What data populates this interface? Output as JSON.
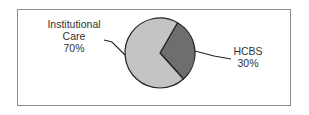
{
  "chart_data": {
    "type": "pie",
    "title": "",
    "slices": [
      {
        "name": "Institutional Care",
        "label_lines": [
          "Institutional",
          "Care",
          "70%"
        ],
        "value": 70,
        "color": "#c4c4c4",
        "label_side": "left"
      },
      {
        "name": "HCBS",
        "label_lines": [
          "HCBS",
          "30%"
        ],
        "value": 30,
        "color": "#6e6e6e",
        "label_side": "right"
      }
    ],
    "start_angle_deg": 30,
    "direction": "clockwise",
    "legend": "none",
    "outline_color": "#222222"
  }
}
